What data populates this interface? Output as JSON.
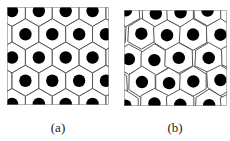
{
  "figure": {
    "panels": [
      {
        "id": "a",
        "label": "(a)",
        "description": "Regular hexagonal tiling with a black dot at the center of each cell",
        "lattice": "regular",
        "cell_stroke_color": "#555555",
        "dot_color": "#000000"
      },
      {
        "id": "b",
        "label": "(b)",
        "description": "Distorted (irregular) hexagonal/Voronoi tiling with a black dot in each cell",
        "lattice": "perturbed",
        "cell_stroke_color": "#555555",
        "dot_color": "#000000"
      }
    ]
  }
}
